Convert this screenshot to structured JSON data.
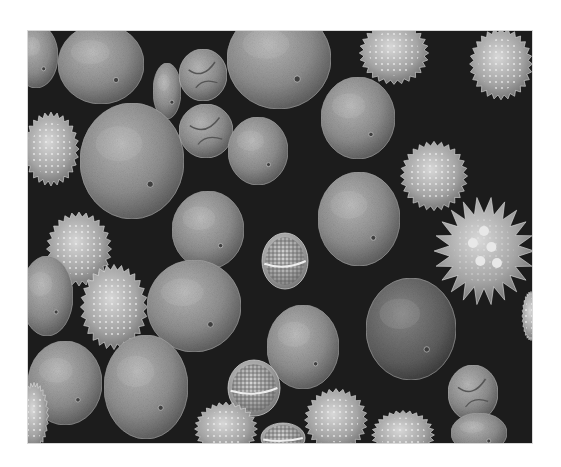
{
  "image": {
    "subject": "Scanning electron micrograph of mixed pollen grains",
    "background_color": "#1c1c1c",
    "frame": {
      "x": 27,
      "y": 30,
      "width": 506,
      "height": 414
    },
    "grains": [
      {
        "type": "smooth",
        "cx": 35,
        "cy": 55,
        "rx": 22,
        "ry": 32
      },
      {
        "type": "smooth",
        "cx": 100,
        "cy": 63,
        "rx": 43,
        "ry": 40
      },
      {
        "type": "smooth",
        "cx": 166,
        "cy": 90,
        "rx": 14,
        "ry": 28
      },
      {
        "type": "folded",
        "cx": 202,
        "cy": 74,
        "rx": 24,
        "ry": 26
      },
      {
        "type": "smooth",
        "cx": 278,
        "cy": 58,
        "rx": 52,
        "ry": 50
      },
      {
        "type": "spiky",
        "cx": 393,
        "cy": 52,
        "rx": 31,
        "ry": 28
      },
      {
        "type": "spiky",
        "cx": 500,
        "cy": 63,
        "rx": 28,
        "ry": 32
      },
      {
        "type": "smooth",
        "cx": 131,
        "cy": 160,
        "rx": 52,
        "ry": 58
      },
      {
        "type": "folded",
        "cx": 205,
        "cy": 130,
        "rx": 27,
        "ry": 27
      },
      {
        "type": "smooth",
        "cx": 257,
        "cy": 150,
        "rx": 30,
        "ry": 34
      },
      {
        "type": "smooth",
        "cx": 357,
        "cy": 117,
        "rx": 37,
        "ry": 41
      },
      {
        "type": "spiky",
        "cx": 50,
        "cy": 148,
        "rx": 25,
        "ry": 33
      },
      {
        "type": "spiky",
        "cx": 433,
        "cy": 175,
        "rx": 30,
        "ry": 31
      },
      {
        "type": "smooth",
        "cx": 358,
        "cy": 218,
        "rx": 41,
        "ry": 47
      },
      {
        "type": "bigspiky",
        "cx": 483,
        "cy": 250,
        "rx": 37,
        "ry": 40
      },
      {
        "type": "smooth",
        "cx": 207,
        "cy": 229,
        "rx": 36,
        "ry": 39
      },
      {
        "type": "reticulate",
        "cx": 284,
        "cy": 260,
        "rx": 23,
        "ry": 28
      },
      {
        "type": "spiky",
        "cx": 78,
        "cy": 248,
        "rx": 29,
        "ry": 33
      },
      {
        "type": "smooth",
        "cx": 46,
        "cy": 295,
        "rx": 26,
        "ry": 40
      },
      {
        "type": "spiky",
        "cx": 113,
        "cy": 306,
        "rx": 30,
        "ry": 38
      },
      {
        "type": "smooth",
        "cx": 193,
        "cy": 305,
        "rx": 47,
        "ry": 46
      },
      {
        "type": "dark",
        "cx": 410,
        "cy": 328,
        "rx": 45,
        "ry": 51
      },
      {
        "type": "smooth",
        "cx": 302,
        "cy": 346,
        "rx": 36,
        "ry": 42
      },
      {
        "type": "smooth",
        "cx": 64,
        "cy": 382,
        "rx": 37,
        "ry": 42
      },
      {
        "type": "smooth",
        "cx": 145,
        "cy": 386,
        "rx": 42,
        "ry": 52
      },
      {
        "type": "reticulate",
        "cx": 253,
        "cy": 387,
        "rx": 26,
        "ry": 28
      },
      {
        "type": "spiky",
        "cx": 225,
        "cy": 428,
        "rx": 28,
        "ry": 24
      },
      {
        "type": "spiky",
        "cx": 335,
        "cy": 419,
        "rx": 28,
        "ry": 28
      },
      {
        "type": "spiky",
        "cx": 402,
        "cy": 434,
        "rx": 28,
        "ry": 22
      },
      {
        "type": "spiky",
        "cx": 33,
        "cy": 415,
        "rx": 13,
        "ry": 30
      },
      {
        "type": "folded",
        "cx": 472,
        "cy": 392,
        "rx": 25,
        "ry": 28
      },
      {
        "type": "smooth",
        "cx": 478,
        "cy": 432,
        "rx": 28,
        "ry": 20
      },
      {
        "type": "reticulate",
        "cx": 282,
        "cy": 437,
        "rx": 22,
        "ry": 15
      },
      {
        "type": "spiky",
        "cx": 530,
        "cy": 315,
        "rx": 8,
        "ry": 22
      }
    ]
  }
}
